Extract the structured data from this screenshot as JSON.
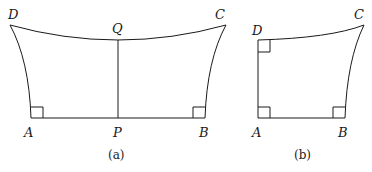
{
  "figure_a": {
    "caption": "(a)",
    "labels": {
      "D": "D",
      "Q": "Q",
      "C": "C",
      "A": "A",
      "P": "P",
      "B": "B"
    }
  },
  "figure_b": {
    "caption": "(b)",
    "labels": {
      "D": "D",
      "C": "C",
      "A": "A",
      "B": "B"
    }
  },
  "colors": {
    "stroke": "#1a1a1a",
    "background": "#ffffff"
  }
}
